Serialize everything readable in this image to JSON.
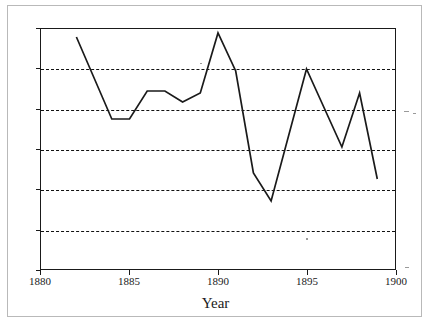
{
  "chart_data": {
    "type": "line",
    "title": "",
    "xlabel": "Year",
    "ylabel": "",
    "xlim": [
      1880,
      1900
    ],
    "ylim": [
      0.0,
      1.2
    ],
    "grid": true,
    "grid_axis": "y",
    "grid_style": "dashed",
    "legend": null,
    "xticks": [
      1880,
      1885,
      1890,
      1895,
      1900
    ],
    "xtick_labels": [
      "1880",
      "1885",
      "1890",
      "1895",
      "1900"
    ],
    "yticks": [
      0.0,
      0.2,
      0.4,
      0.6,
      0.8,
      1.0,
      1.2
    ],
    "ytick_labels": [
      "0.0",
      "0.2",
      "0.4",
      "0.6",
      "0.8",
      "1.0",
      "1.2"
    ],
    "line_color": "#1a1a1a",
    "series": [
      {
        "name": "series-1",
        "x": [
          1882,
          1884,
          1885,
          1886,
          1887,
          1888,
          1889,
          1890,
          1891,
          1892,
          1893,
          1895,
          1897,
          1898,
          1899
        ],
        "values": [
          1.16,
          0.75,
          0.75,
          0.89,
          0.89,
          0.835,
          0.88,
          1.18,
          0.99,
          0.48,
          0.34,
          1.0,
          0.61,
          0.88,
          0.45
        ]
      }
    ]
  },
  "axes": {
    "x_title": "Year"
  }
}
